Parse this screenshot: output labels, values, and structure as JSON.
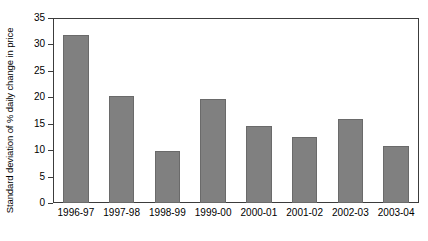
{
  "chart_data": {
    "type": "bar",
    "title": "",
    "subtitle": "",
    "xlabel": "",
    "ylabel": "Standard deviation of % daily change in price",
    "categories": [
      "1996-97",
      "1997-98",
      "1998-99",
      "1999-00",
      "2000-01",
      "2001-02",
      "2002-03",
      "2003-04"
    ],
    "values": [
      31.8,
      20.2,
      9.8,
      19.6,
      14.6,
      12.5,
      15.9,
      10.8
    ],
    "ylim": [
      0,
      35
    ],
    "ytick_labels": [
      "0",
      "5",
      "10",
      "15",
      "20",
      "25",
      "30",
      "35"
    ],
    "ytick_values": [
      0,
      5,
      10,
      15,
      20,
      25,
      30,
      35
    ],
    "grid": false,
    "legend": false,
    "legend_position": "none",
    "series": [
      {
        "name": "Standard deviation of % daily change in price",
        "values": [
          31.8,
          20.2,
          9.8,
          19.6,
          14.6,
          12.5,
          15.9,
          10.8
        ]
      }
    ],
    "colors": {
      "bar_fill": "#808080",
      "bar_edge": "#6a6a6a",
      "axis": "#3c3c3c",
      "text": "#000000",
      "background": "#ffffff"
    }
  }
}
